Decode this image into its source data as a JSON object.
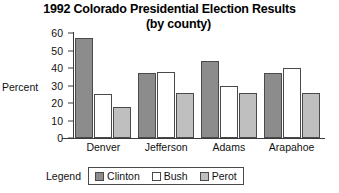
{
  "chart_data": {
    "type": "bar",
    "title": "1992 Colorado Presidential Election Results",
    "subtitle": "(by county)",
    "xlabel": "",
    "ylabel": "Percent",
    "ylim": [
      0,
      60
    ],
    "ytick_step": 10,
    "yticks": [
      60,
      50,
      40,
      30,
      20,
      10,
      0
    ],
    "grid": false,
    "legend_title": "Legend",
    "legend_position": "bottom",
    "categories": [
      "Denver",
      "Jefferson",
      "Adams",
      "Arapahoe"
    ],
    "series": [
      {
        "name": "Clinton",
        "color": "#8c8c8c",
        "values": [
          57,
          37,
          44,
          37
        ]
      },
      {
        "name": "Bush",
        "color": "#ffffff",
        "values": [
          25,
          38,
          30,
          40
        ]
      },
      {
        "name": "Perot",
        "color": "#bfbfbf",
        "values": [
          18,
          26,
          26,
          26
        ]
      }
    ]
  }
}
